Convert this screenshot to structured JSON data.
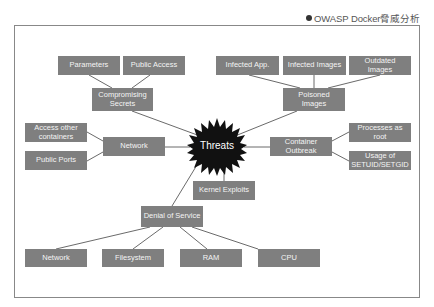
{
  "caption": {
    "bullet": "●",
    "text": "OWASP Docker脅威分析"
  },
  "top_cutoff_text": "",
  "diagram": {
    "center": {
      "id": "threats",
      "label": "Threats",
      "shape": "starburst",
      "color": "#111111"
    },
    "colors": {
      "node_fill": "#7f7f7f",
      "node_text": "#f4f4f4",
      "line": "#444444",
      "frame": "#888888"
    },
    "nodes": {
      "parameters": "Parameters",
      "public_access": "Public Access",
      "compromising_secrets": "Compromising\nSecrets",
      "infected_app": "Infected App.",
      "infected_images": "Infected Images",
      "outdated_images": "Outdated\nImages",
      "poisoned_images": "Poisoned\nImages",
      "access_other_containers": "Access other\ncontainers",
      "public_ports": "Public Ports",
      "network": "Network",
      "container_outbreak": "Container\nOutbreak",
      "processes_as_root": "Processes as\nroot",
      "usage_setuid": "Usage of\nSETUID/SETGID",
      "kernel_exploits": "Kernel Exploits",
      "denial_of_service": "Denial of Service",
      "dos_network": "Network",
      "dos_filesystem": "Filesystem",
      "dos_ram": "RAM",
      "dos_cpu": "CPU"
    },
    "edges": [
      [
        "threats",
        "compromising_secrets"
      ],
      [
        "threats",
        "poisoned_images"
      ],
      [
        "threats",
        "network"
      ],
      [
        "threats",
        "container_outbreak"
      ],
      [
        "threats",
        "kernel_exploits"
      ],
      [
        "threats",
        "denial_of_service"
      ],
      [
        "compromising_secrets",
        "parameters"
      ],
      [
        "compromising_secrets",
        "public_access"
      ],
      [
        "poisoned_images",
        "infected_app"
      ],
      [
        "poisoned_images",
        "infected_images"
      ],
      [
        "poisoned_images",
        "outdated_images"
      ],
      [
        "network",
        "access_other_containers"
      ],
      [
        "network",
        "public_ports"
      ],
      [
        "container_outbreak",
        "processes_as_root"
      ],
      [
        "container_outbreak",
        "usage_setuid"
      ],
      [
        "denial_of_service",
        "dos_network"
      ],
      [
        "denial_of_service",
        "dos_filesystem"
      ],
      [
        "denial_of_service",
        "dos_ram"
      ],
      [
        "denial_of_service",
        "dos_cpu"
      ]
    ]
  }
}
